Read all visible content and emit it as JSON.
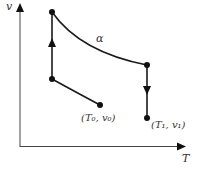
{
  "diagram": {
    "type": "thermodynamic-process",
    "axes": {
      "x_label": "T",
      "y_label": "v"
    },
    "curve_label": "α",
    "points": {
      "start": {
        "label": "(T₀, v₀)"
      },
      "end": {
        "label": "(T₁, v₁)"
      }
    },
    "colors": {
      "line": "#1a1a1a",
      "axis": "#333333",
      "text": "#333333"
    }
  }
}
